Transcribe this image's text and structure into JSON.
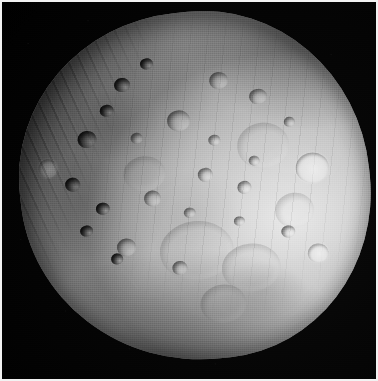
{
  "image": {
    "subject": "Phobos",
    "subject_type": "moon",
    "parent_body": "Mars",
    "view": "full-disk grayscale photograph",
    "palette": {
      "space_black": "#000000",
      "terminator_shadow": "#0a0a0a",
      "regolith_mid": "#b5b5b5",
      "regolith_bright": "#e9e9e9",
      "limb_highlight": "#ededed",
      "frame_border": "#f2f2f2"
    },
    "lighting": {
      "sun_direction": "right",
      "terminator_edge": "upper-left"
    },
    "frame": {
      "border_width_px": 2,
      "width_px": 378,
      "height_px": 381
    },
    "features": [
      {
        "name": "bright-limb-crater",
        "kind": "bright",
        "cx": 83,
        "cy": 49,
        "r": 9
      },
      {
        "name": "terminator-ridge-field",
        "kind": "ridges",
        "cx": 20,
        "cy": 24,
        "r": 0
      },
      {
        "name": "large-subdued-basin-south",
        "kind": "ghost",
        "cx": 47,
        "cy": 79,
        "r": 22
      },
      {
        "name": "fresh-crater-east",
        "kind": "bright",
        "cx": 86,
        "cy": 53,
        "r": 11
      }
    ]
  }
}
